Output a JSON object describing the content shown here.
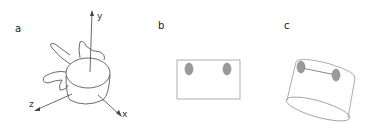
{
  "panels": [
    {
      "label": "a",
      "description": "vertebra with 3D axes",
      "axes": {
        "x": "x",
        "y": "y",
        "z": "z"
      }
    },
    {
      "label": "b",
      "description": "rectangle with two gray ellipses"
    },
    {
      "label": "c",
      "description": "tilted cylinder with two gray ellipses joined by a line"
    }
  ],
  "colors": {
    "line": "#444444",
    "box": "#999999",
    "marker": "#9a9a9a",
    "marker_stroke": "#7a7a7a"
  }
}
